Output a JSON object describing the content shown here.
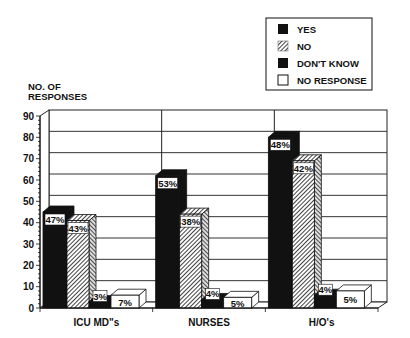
{
  "chart_data": {
    "type": "bar",
    "title": "",
    "ylabel": "NO. OF RESPONSES",
    "ylabel_lines": [
      "NO. OF",
      "RESPONSES"
    ],
    "xlabel": "",
    "ylim": [
      0,
      90
    ],
    "yticks": [
      0,
      10,
      20,
      30,
      40,
      50,
      60,
      70,
      80,
      90
    ],
    "grid": true,
    "legend_position": "top-right",
    "categories": [
      "ICU MD\"s",
      "NURSES",
      "H/O's"
    ],
    "series": [
      {
        "name": "YES",
        "values": [
          45,
          62,
          80
        ],
        "labels": [
          "47%",
          "53%",
          "48%"
        ],
        "fill": "solid-black"
      },
      {
        "name": "NO",
        "values": [
          41,
          44,
          69
        ],
        "labels": [
          "43%",
          "38%",
          "42%"
        ],
        "fill": "diagonal-hatch"
      },
      {
        "name": "DON'T KNOW",
        "values": [
          3,
          4,
          6
        ],
        "labels": [
          "3%",
          "4%",
          "4%"
        ],
        "fill": "solid-black"
      },
      {
        "name": "NO RESPONSE",
        "values": [
          6,
          5,
          8
        ],
        "labels": [
          "7%",
          "5%",
          "5%"
        ],
        "fill": "white"
      }
    ]
  },
  "colors": {
    "ink": "#111111",
    "paper": "#ffffff",
    "grid": "#333333"
  }
}
